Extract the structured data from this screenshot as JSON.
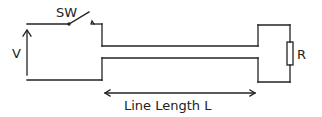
{
  "diagram": {
    "type": "circuit",
    "labels": {
      "switch": "SW",
      "voltage": "V",
      "resistor": "R",
      "line_length": "Line Length L"
    },
    "components": [
      {
        "id": "voltage-source",
        "label": "V",
        "kind": "voltage arrow"
      },
      {
        "id": "switch",
        "label": "SW",
        "kind": "open switch"
      },
      {
        "id": "transmission-line",
        "label": "Line Length L",
        "kind": "two-conductor line"
      },
      {
        "id": "load-resistor",
        "label": "R",
        "kind": "resistor"
      }
    ],
    "colors": {
      "stroke": "#222222",
      "background": "#ffffff"
    }
  }
}
